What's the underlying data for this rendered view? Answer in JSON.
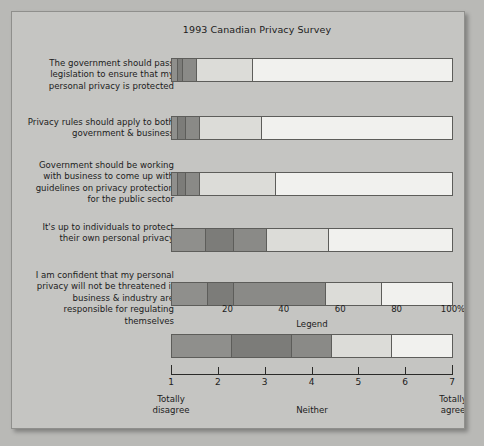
{
  "chart_data": {
    "type": "bar",
    "title": "1993 Canadian Privacy Survey",
    "subtype": "stacked-horizontal-likert",
    "xlabel": "",
    "ylabel": "",
    "xlim": [
      0,
      100
    ],
    "grid": false,
    "legend_position": "bottom",
    "legend_title": "Legend",
    "scale": {
      "points": [
        "1",
        "2",
        "3",
        "4",
        "5",
        "6",
        "7"
      ],
      "low_label": "Totally disagree",
      "mid_label": "Neither",
      "high_label": "Totally agree"
    },
    "x_ticks": [
      {
        "label": "20",
        "value": 20
      },
      {
        "label": "40",
        "value": 40
      },
      {
        "label": "60",
        "value": 60
      },
      {
        "label": "80",
        "value": 80
      },
      {
        "label": "100%",
        "value": 100
      }
    ],
    "categories": [
      "The government should pass legislation to ensure that my personal privacy is protected",
      "Privacy rules should apply to both government & business",
      "Government should be working with business to come up with guidelines on privacy protection for the public sector",
      "It's up to individuals to protect their own personal privacy",
      "I am confident that my personal privacy will not be threatened if business & industry are responsible for regulating themselves"
    ],
    "series": [
      {
        "name": "1 Totally disagree",
        "color": "#8f8f8c",
        "values": [
          2,
          2,
          2,
          12,
          13
        ]
      },
      {
        "name": "2",
        "color": "#7c7c79",
        "values": [
          2,
          3,
          3,
          10,
          9
        ]
      },
      {
        "name": "3",
        "color": "#8a8a87",
        "values": [
          5,
          5,
          5,
          12,
          33
        ]
      },
      {
        "name": "4",
        "color": "#dcdcd8",
        "values": [
          20,
          22,
          27,
          22,
          20
        ]
      },
      {
        "name": "5",
        "color": "#f1f1ee",
        "values": [
          71,
          68,
          63,
          44,
          25
        ]
      }
    ],
    "legend_segments": [
      {
        "label": "1",
        "color": "#8f8f8c",
        "span": 1.5
      },
      {
        "label": "2",
        "color": "#7c7c79",
        "span": 1.5
      },
      {
        "label": "3",
        "color": "#8a8a87",
        "span": 1.0
      },
      {
        "label": "4",
        "color": "#dcdcd8",
        "span": 1.5
      },
      {
        "label": "5",
        "color": "#f1f1ee",
        "span": 1.5
      }
    ]
  },
  "chart": {
    "title": "1993 Canadian Privacy Survey",
    "legend_title": "Legend",
    "low_label_line1": "Totally",
    "low_label_line2": "disagree",
    "mid_label": "Neither",
    "high_label_line1": "Totally",
    "high_label_line2": "agree",
    "rows": [
      {
        "label": "The government should pass legislation to ensure that my personal privacy is protected"
      },
      {
        "label": "Privacy rules should apply to both government & business"
      },
      {
        "label": "Government should be working with business to come up with guidelines on privacy protection for the public sector"
      },
      {
        "label": "It's up to individuals to protect their own personal privacy"
      },
      {
        "label": "I am confident that my personal privacy will not be threatened if business & industry are responsible for regulating themselves"
      }
    ],
    "colors": {
      "background": "#c5c5c2",
      "page": "#b9b9b6",
      "border": "#5d5d5a",
      "text": "#1c1c1c"
    }
  }
}
